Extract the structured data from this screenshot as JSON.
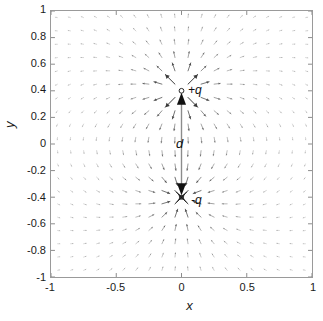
{
  "chart_data": {
    "type": "scatter",
    "title": "",
    "xlabel": "x",
    "ylabel": "y",
    "xlim": [
      -1,
      1
    ],
    "ylim": [
      -1,
      1
    ],
    "grid": false,
    "xticks": [
      "-1",
      "-0.5",
      "0",
      "0.5",
      "1"
    ],
    "xtick_values": [
      -1,
      -0.5,
      0,
      0.5,
      1
    ],
    "yticks": [
      "1",
      "0.8",
      "0.6",
      "0.4",
      "0.2",
      "0",
      "-0.2",
      "-0.4",
      "-0.6",
      "-0.8",
      "-1"
    ],
    "ytick_values": [
      1,
      0.8,
      0.6,
      0.4,
      0.2,
      0,
      -0.2,
      -0.4,
      -0.6,
      -0.8,
      -1
    ],
    "field": {
      "kind": "dipole-quiver",
      "grid_step": 0.1,
      "grid_range": [
        -0.95,
        0.95
      ],
      "arrow_color": "#3a3a3a"
    },
    "charges": [
      {
        "label": "+q",
        "sign": "+",
        "marker": "circle",
        "x": 0,
        "y": 0.4,
        "color": "#111111"
      },
      {
        "label": "-q",
        "sign": "-",
        "marker": "cross",
        "x": 0,
        "y": -0.4,
        "color": "#111111"
      }
    ],
    "annotations": [
      {
        "label": "d",
        "kind": "double-arrow",
        "from": [
          0,
          0.4
        ],
        "to": [
          0,
          -0.4
        ],
        "label_x": -0.06,
        "label_y": 0.02,
        "line_color": "#8c8c8c",
        "head_color": "#111111"
      }
    ]
  },
  "axis": {
    "box_color": "#9a9a9a",
    "tick_color": "#6e6e6e",
    "text_color": "#1a1a1a"
  }
}
